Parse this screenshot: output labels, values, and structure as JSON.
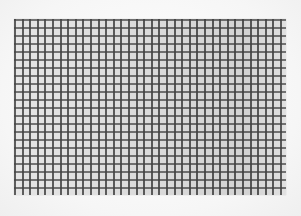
{
  "image": {
    "description": "Photograph of a printed square grid (graph paper) on a white background",
    "grid": {
      "columns": 36,
      "rows": 22,
      "line_color": "#464646",
      "paper_color": "#eaeaea",
      "background_color": "#fbfbfb"
    }
  }
}
